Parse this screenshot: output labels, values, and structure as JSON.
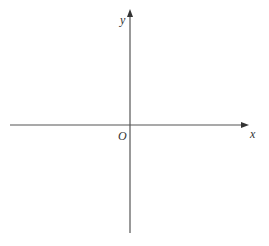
{
  "diagram": {
    "type": "cartesian-axes",
    "axis_color": "#555555",
    "x_axis": {
      "label": "x",
      "from_px": 10,
      "to_px": 248,
      "y_px": 125
    },
    "y_axis": {
      "label": "y",
      "from_px": 233,
      "to_px": 10,
      "x_px": 130
    },
    "origin": {
      "label": "O"
    }
  }
}
